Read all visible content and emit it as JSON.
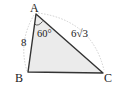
{
  "diagram": {
    "type": "triangle",
    "vertices": [
      {
        "label": "A",
        "x": 36,
        "y": 14
      },
      {
        "label": "B",
        "x": 28,
        "y": 72
      },
      {
        "label": "C",
        "x": 103,
        "y": 73
      }
    ],
    "side_labels": {
      "AB": "8",
      "AC": "6√3"
    },
    "angle_label": {
      "vertex": "A",
      "text": "60°"
    },
    "fill_color": "#ebebeb",
    "stroke_color": "#333333",
    "arc_color": "#c8c8c8"
  }
}
